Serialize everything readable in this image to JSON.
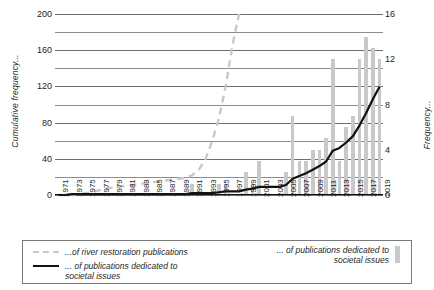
{
  "chart_data": {
    "type": "bar",
    "title": "",
    "xlabel": "",
    "ylabel": "Cumulative frequency...",
    "y2label": "Frequency...",
    "grid": true,
    "legend_position": "bottom",
    "ylim": [
      0,
      200
    ],
    "y2lim": [
      0,
      16
    ],
    "yticks": [
      0,
      40,
      80,
      120,
      160,
      200
    ],
    "y2ticks": [
      0,
      4,
      8,
      12,
      16
    ],
    "minor_gridline_step": 20,
    "x": [
      1971,
      1972,
      1973,
      1974,
      1975,
      1976,
      1977,
      1978,
      1979,
      1980,
      1981,
      1982,
      1983,
      1984,
      1985,
      1986,
      1987,
      1988,
      1989,
      1990,
      1991,
      1992,
      1993,
      1994,
      1995,
      1996,
      1997,
      1998,
      1999,
      2000,
      2001,
      2002,
      2003,
      2004,
      2005,
      2006,
      2007,
      2008,
      2009,
      2010,
      2011,
      2012,
      2013,
      2014,
      2015,
      2016,
      2017,
      2018,
      2019
    ],
    "xtick_labels": [
      "1971",
      "1973",
      "1975",
      "1977",
      "1979",
      "1981",
      "1983",
      "1985",
      "1987",
      "1989",
      "1991",
      "1993",
      "1995",
      "1997",
      "1999",
      "2001",
      "2003",
      "2005",
      "2007",
      "2009",
      "2011",
      "2013",
      "2015",
      "2017",
      "2019"
    ],
    "series": [
      {
        "name": "...of publications dedicated to societal issues",
        "kind": "bar",
        "axis": "right",
        "color": "#c9c9c9",
        "values": [
          0,
          0,
          0,
          0,
          0,
          0,
          0,
          0,
          0,
          0,
          0,
          0,
          0,
          0,
          0,
          0,
          0,
          0,
          0,
          0,
          1,
          0,
          0,
          0,
          1,
          1,
          0,
          0,
          2,
          1,
          3,
          0,
          0,
          0,
          2,
          7,
          3,
          3,
          4,
          4,
          5,
          12,
          3,
          6,
          7,
          12,
          14,
          13,
          12
        ]
      },
      {
        "name": "...of river restoration publications",
        "kind": "line",
        "style": "dashed",
        "axis": "left",
        "color": "#c9c9c9",
        "values": [
          0,
          0,
          0,
          1,
          2,
          3,
          5,
          7,
          8,
          9,
          10,
          11,
          12,
          13,
          14,
          15,
          16,
          17,
          18,
          19,
          22,
          28,
          40,
          60,
          85,
          120,
          165,
          200,
          null,
          null,
          null,
          null,
          null,
          null,
          null,
          null,
          null,
          null,
          null,
          null,
          null,
          null,
          null,
          null,
          null,
          null,
          null,
          null,
          null
        ]
      },
      {
        "name": "...of publications dedicated to societal issues",
        "kind": "line",
        "style": "solid",
        "axis": "left",
        "color": "#111111",
        "values": [
          0,
          0,
          1,
          1,
          1,
          1,
          1,
          1,
          1,
          1,
          1,
          1,
          1,
          1,
          1,
          1,
          1,
          1,
          1,
          1,
          2,
          2,
          2,
          2,
          3,
          4,
          4,
          4,
          6,
          7,
          9,
          9,
          9,
          9,
          11,
          18,
          21,
          24,
          28,
          32,
          37,
          49,
          52,
          58,
          65,
          77,
          91,
          106,
          120
        ]
      }
    ]
  },
  "legend": {
    "items": [
      {
        "label": "...of river restoration publications",
        "marker": "dashed-line"
      },
      {
        "label": "... of publications dedicated to\nsocietal issues",
        "marker": "solid-line"
      },
      {
        "label": "... of publications dedicated to\nsocietal issues",
        "marker": "bar-swatch"
      }
    ]
  }
}
